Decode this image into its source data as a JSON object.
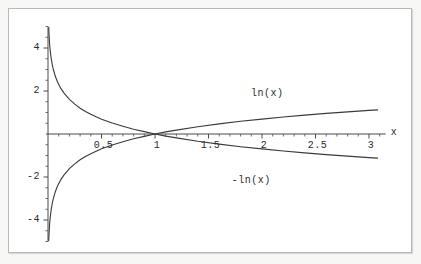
{
  "figure": {
    "background_color": "#f7f7f5",
    "plot_background_color": "#ffffff",
    "frame_color": "#b9b9b9",
    "axis_color": "#4a4a4a",
    "curve_color": "#3a3a3a"
  },
  "chart_data": {
    "type": "line",
    "title": "",
    "subtitle": "",
    "xlabel": "x",
    "ylabel": "",
    "xlim": [
      0,
      3.1
    ],
    "ylim": [
      -5.0,
      5.0
    ],
    "grid": false,
    "legend_position": "inline-annotations",
    "xticks": [
      0.5,
      1,
      1.5,
      2,
      2.5,
      3
    ],
    "xtick_labels": [
      "0.5",
      "1",
      "1.5",
      "2",
      "2.5",
      "3"
    ],
    "yticks": [
      -4,
      -2,
      2,
      4
    ],
    "ytick_labels": [
      "-4",
      "-2",
      "2",
      "4"
    ],
    "xminor_step": 0.1,
    "yminor_step": 0.5,
    "annotations": [
      {
        "text": "ln(x)",
        "x": 2.05,
        "y": 2.15
      },
      {
        "text": "-ln(x)",
        "x": 1.9,
        "y": -1.9
      }
    ],
    "series": [
      {
        "name": "ln(x)",
        "label": "ln(x)",
        "color": "#3a3a3a",
        "x": [
          0.007,
          0.01,
          0.015,
          0.02,
          0.03,
          0.04,
          0.05,
          0.07,
          0.09,
          0.12,
          0.15,
          0.2,
          0.25,
          0.3,
          0.35,
          0.4,
          0.45,
          0.5,
          0.6,
          0.7,
          0.8,
          0.9,
          1.0,
          1.1,
          1.2,
          1.4,
          1.6,
          1.8,
          2.0,
          2.2,
          2.4,
          2.6,
          2.8,
          3.0,
          3.08
        ],
        "y": [
          -4.96,
          -4.61,
          -4.2,
          -3.91,
          -3.51,
          -3.22,
          -3.0,
          -2.66,
          -2.41,
          -2.12,
          -1.9,
          -1.61,
          -1.39,
          -1.2,
          -1.05,
          -0.92,
          -0.8,
          -0.69,
          -0.51,
          -0.36,
          -0.22,
          -0.11,
          0.0,
          0.1,
          0.18,
          0.34,
          0.47,
          0.59,
          0.69,
          0.79,
          0.88,
          0.96,
          1.03,
          1.1,
          1.12
        ]
      },
      {
        "name": "-ln(x)",
        "label": "-ln(x)",
        "color": "#3a3a3a",
        "x": [
          0.007,
          0.01,
          0.015,
          0.02,
          0.03,
          0.04,
          0.05,
          0.07,
          0.09,
          0.12,
          0.15,
          0.2,
          0.25,
          0.3,
          0.35,
          0.4,
          0.45,
          0.5,
          0.6,
          0.7,
          0.8,
          0.9,
          1.0,
          1.1,
          1.2,
          1.4,
          1.6,
          1.8,
          2.0,
          2.2,
          2.4,
          2.6,
          2.8,
          3.0,
          3.08
        ],
        "y": [
          4.96,
          4.61,
          4.2,
          3.91,
          3.51,
          3.22,
          3.0,
          2.66,
          2.41,
          2.12,
          1.9,
          1.61,
          1.39,
          1.2,
          1.05,
          0.92,
          0.8,
          0.69,
          0.51,
          0.36,
          0.22,
          0.11,
          0.0,
          -0.1,
          -0.18,
          -0.34,
          -0.47,
          -0.59,
          -0.69,
          -0.79,
          -0.88,
          -0.96,
          -1.03,
          -1.1,
          -1.12
        ]
      }
    ]
  }
}
